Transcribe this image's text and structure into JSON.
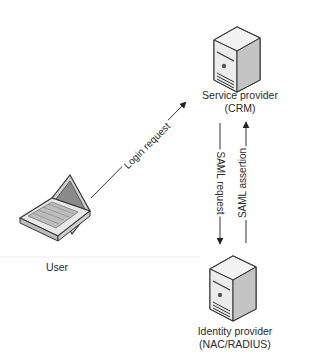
{
  "diagram": {
    "nodes": {
      "service_provider": {
        "line1": "Service provider",
        "line2": "(CRM)",
        "icon": "server-icon"
      },
      "identity_provider": {
        "line1": "Identity provider",
        "line2": "(NAC/RADIUS)",
        "icon": "server-icon"
      },
      "user": {
        "label": "User",
        "icon": "laptop-icon"
      }
    },
    "edges": {
      "login_request": {
        "label": "Login request",
        "from": "User",
        "to": "Service provider (CRM)"
      },
      "saml_request": {
        "label": "SAML request",
        "from": "Service provider (CRM)",
        "to": "Identity provider (NAC/RADIUS)"
      },
      "saml_assertion": {
        "label": "SAML assertion",
        "from": "Identity provider (NAC/RADIUS)",
        "to": "Service provider (CRM)"
      }
    },
    "colors": {
      "line": "#333333",
      "server_body": "#e6e6e6",
      "server_side": "#c8c8c8",
      "outline": "#333333"
    }
  }
}
